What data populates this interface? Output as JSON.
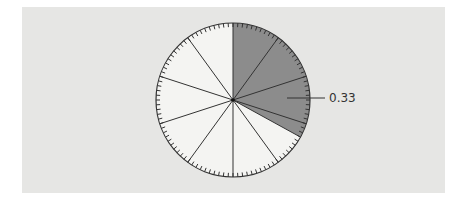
{
  "chart_data": {
    "type": "pie",
    "title": "",
    "sectors": 10,
    "sector_fraction": 0.1,
    "tick_count": 100,
    "highlighted": {
      "start": 0,
      "value": 0.33,
      "label": "0.33"
    },
    "values": [
      0.33,
      0.67
    ],
    "categories": [
      "shaded",
      "unshaded"
    ],
    "annotations": [
      {
        "text": "0.33",
        "position": "right",
        "leader_line": true
      }
    ],
    "grid": false,
    "legend": null
  },
  "colors": {
    "panel": "#e6e6e4",
    "pie_fill": "#f4f4f2",
    "shaded": "#8c8c8c",
    "stroke": "#333333"
  },
  "geometry": {
    "cx": 233,
    "cy": 100,
    "r": 77
  },
  "label": {
    "text": "0.33"
  }
}
